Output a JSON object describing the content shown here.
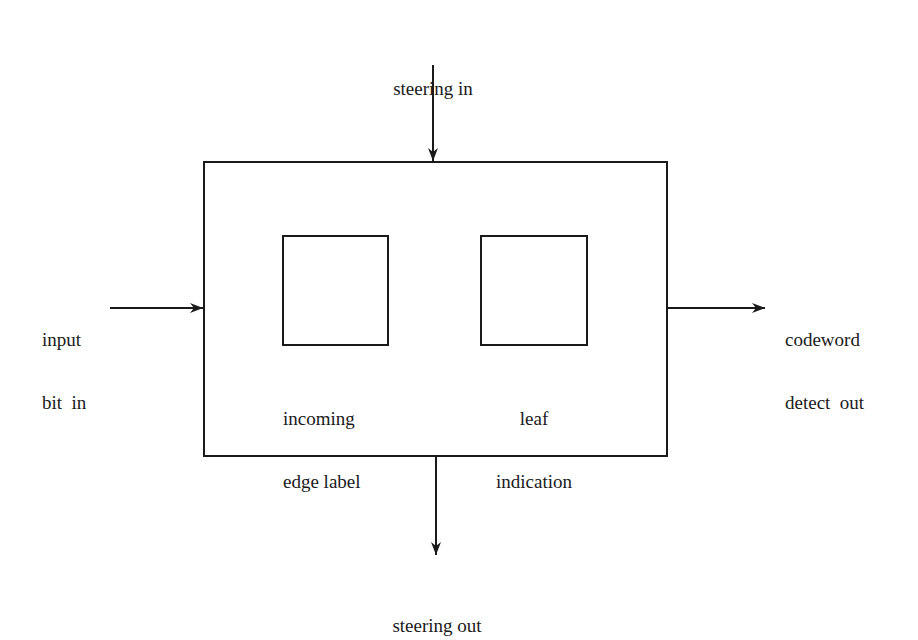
{
  "diagram": {
    "type": "block-diagram",
    "colors": {
      "stroke": "#1a1a1a",
      "background": "#ffffff"
    },
    "main_block": {
      "label": ""
    },
    "inner_blocks": [
      {
        "id": "incoming-edge-label",
        "label_lines": [
          "incoming",
          "edge label"
        ]
      },
      {
        "id": "leaf-indication",
        "label_lines": [
          "leaf",
          "indication"
        ]
      }
    ],
    "signals": {
      "steering_in": {
        "label": "steering in",
        "direction": "into top"
      },
      "input_bit_in": {
        "label_lines": [
          "input",
          "bit  in"
        ],
        "direction": "into left"
      },
      "codeword_detect_out": {
        "label_lines": [
          "codeword",
          "detect  out"
        ],
        "direction": "out of right"
      },
      "steering_out": {
        "label": "steering out",
        "direction": "out of bottom"
      }
    }
  }
}
